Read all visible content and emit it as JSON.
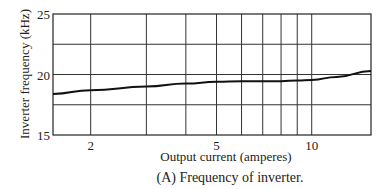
{
  "chart_data": {
    "type": "line",
    "title": "(A) Frequency of inverter.",
    "xlabel": "Output current (amperes)",
    "ylabel": "Inverter frequency (kHz)",
    "xscale": "log",
    "xlim": [
      1.52,
      15.4
    ],
    "ylim": [
      15,
      25
    ],
    "x_tick_labels": [
      "2",
      "5",
      "10"
    ],
    "x_ticks": [
      2,
      5,
      10
    ],
    "x_gridlines": [
      2,
      3,
      4,
      5,
      6,
      7,
      8,
      9,
      10
    ],
    "y_tick_labels": [
      "15",
      "20",
      "25"
    ],
    "y_ticks": [
      15,
      20,
      25
    ],
    "y_gridlines": [
      17.5,
      20,
      22.5
    ],
    "grid": true,
    "legend": null,
    "series": [
      {
        "name": "Inverter frequency",
        "x": [
          1.52,
          2,
          3,
          4,
          5,
          6,
          7,
          8,
          9,
          10,
          12,
          15.4
        ],
        "values": [
          18.4,
          18.7,
          19.0,
          19.25,
          19.4,
          19.45,
          19.45,
          19.45,
          19.5,
          19.55,
          19.8,
          20.3
        ]
      }
    ]
  },
  "labels": {
    "ylabel": "Inverter frequency (kHz)",
    "xlabel": "Output current (amperes)",
    "caption": "(A) Frequency of inverter."
  }
}
